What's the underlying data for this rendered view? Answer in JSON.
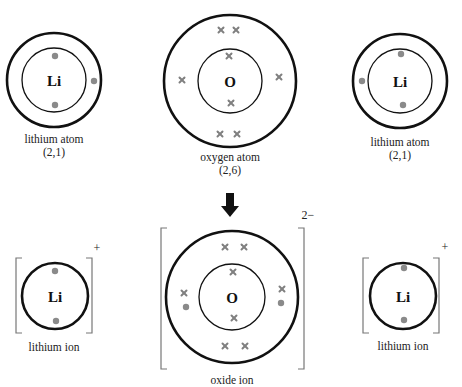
{
  "diagram": {
    "atoms": [
      {
        "symbol": "Li",
        "name": "lithium atom",
        "config": "(2,1)"
      },
      {
        "symbol": "O",
        "name": "oxygen atom",
        "config": "(2,6)"
      },
      {
        "symbol": "Li",
        "name": "lithium atom",
        "config": "(2,1)"
      }
    ],
    "ions": [
      {
        "symbol": "Li",
        "name": "lithium ion",
        "charge": "+"
      },
      {
        "symbol": "O",
        "name": "oxide ion",
        "charge": "2−"
      },
      {
        "symbol": "Li",
        "name": "lithium ion",
        "charge": "+"
      }
    ],
    "arrow": "reaction-arrow-down",
    "colors": {
      "shell": "#111111",
      "lithium_electron": "#8a8a8a",
      "oxygen_electron": "#808080",
      "bracket": "#777777"
    },
    "legend": {
      "dot": "lithium electron",
      "cross": "oxygen electron"
    }
  }
}
